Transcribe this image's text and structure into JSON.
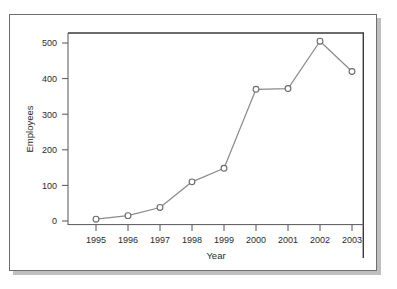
{
  "chart_data": {
    "type": "line",
    "title": "",
    "xlabel": "Year",
    "ylabel": "Employees",
    "categories": [
      "1995",
      "1996",
      "1997",
      "1998",
      "1999",
      "2000",
      "2001",
      "2002",
      "2003"
    ],
    "x": [
      1995,
      1996,
      1997,
      1998,
      1999,
      2000,
      2001,
      2002,
      2003
    ],
    "values": [
      5,
      15,
      38,
      110,
      148,
      370,
      372,
      505,
      420
    ],
    "series": [
      {
        "name": "Employees",
        "values": [
          5,
          15,
          38,
          110,
          148,
          370,
          372,
          505,
          420
        ]
      }
    ],
    "xtick_labels": [
      "1995",
      "1996",
      "1997",
      "1998",
      "1999",
      "2000",
      "2001",
      "2002",
      "2003"
    ],
    "ytick_labels": [
      "0",
      "100",
      "200",
      "300",
      "400",
      "500"
    ],
    "yticks": [
      0,
      100,
      200,
      300,
      400,
      500
    ],
    "ylim": [
      0,
      530
    ],
    "xlim": [
      1994.6,
      2003.5
    ],
    "grid": false,
    "legend": null,
    "marker": "open-circle",
    "line_color": "#8a8a8a",
    "marker_color": "#6b6b6b",
    "axis_color": "#555555",
    "frame_color": "#3a3a3a"
  },
  "colors": {
    "line": "#8a8a8a",
    "marker_stroke": "#6b6b6b",
    "marker_fill": "#ffffff",
    "axis": "#555555",
    "frame": "#3a3a3a",
    "card_border": "#6e6e6e",
    "shadow": "#bfbfbf",
    "text": "#2b2b2b",
    "background": "#ffffff"
  }
}
